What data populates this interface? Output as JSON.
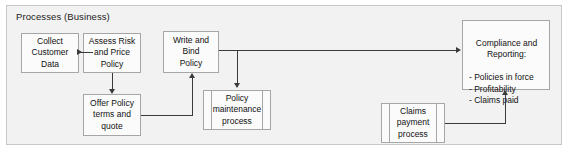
{
  "frame": {
    "title": "Processes (Business)",
    "background_color": "#f2f2f2",
    "border_color": "#c8c8c8"
  },
  "style": {
    "node_fill": "#fbfbfb",
    "node_border": "#a6a6a6",
    "connector_color": "#3a3a3a",
    "text_color": "#111111"
  },
  "nodes": {
    "collect_customer_data": {
      "label": "Collect\nCustomer\nData",
      "shape": "process"
    },
    "assess_risk_and_price_policy": {
      "label": "Assess Risk\nand Price\nPolicy",
      "shape": "process"
    },
    "write_and_bind_policy": {
      "label": "Write and\nBind\nPolicy",
      "shape": "process"
    },
    "offer_policy_terms_and_quote": {
      "label": "Offer Policy\nterms and\nquote",
      "shape": "process"
    },
    "policy_maintenance_process": {
      "label": "Policy\nmaintenance\nprocess",
      "shape": "subprocess"
    },
    "claims_payment_process": {
      "label": "Claims\npayment\nprocess",
      "shape": "subprocess"
    },
    "compliance_and_reporting": {
      "heading": "Compliance and\nReporting:",
      "items": "- Policies in force\n- Profitability\n- Claims paid",
      "shape": "process"
    }
  },
  "connections": [
    {
      "name": "collect-to-assess",
      "from": "collect_customer_data",
      "to": "assess_risk_and_price_policy",
      "direction": "right"
    },
    {
      "name": "assess-to-offer",
      "from": "assess_risk_and_price_policy",
      "to": "offer_policy_terms_and_quote",
      "direction": "down"
    },
    {
      "name": "offer-to-write",
      "from": "offer_policy_terms_and_quote",
      "to": "write_and_bind_policy",
      "direction": "up"
    },
    {
      "name": "write-to-compliance",
      "from": "write_and_bind_policy",
      "to": "compliance_and_reporting",
      "direction": "right"
    },
    {
      "name": "write-to-policy-maintenance",
      "from": "write_and_bind_policy",
      "to": "policy_maintenance_process",
      "direction": "down"
    },
    {
      "name": "claims-to-compliance",
      "from": "claims_payment_process",
      "to": "compliance_and_reporting",
      "direction": "up"
    }
  ]
}
